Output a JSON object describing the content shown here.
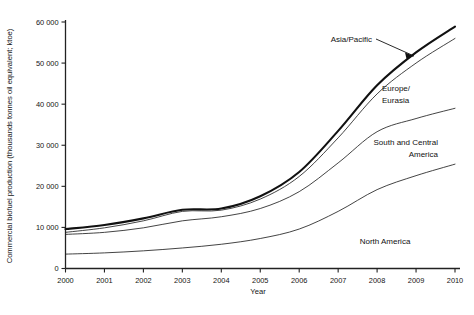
{
  "chart_data": {
    "type": "line",
    "title": "",
    "xlabel": "Year",
    "ylabel": "Commercial biofuel production (thousands tonnes oil equivalent; ktoe)",
    "x": [
      2000,
      2001,
      2002,
      2003,
      2004,
      2005,
      2006,
      2007,
      2008,
      2009,
      2010
    ],
    "xlim": [
      2000,
      2010
    ],
    "ylim": [
      0,
      60000
    ],
    "ytick_labels": [
      "0",
      "10 000",
      "20 000",
      "30 000",
      "40 000",
      "50 000",
      "60 000"
    ],
    "ytick_values": [
      0,
      10000,
      20000,
      30000,
      40000,
      50000,
      60000
    ],
    "xtick_labels": [
      "2000",
      "2001",
      "2002",
      "2003",
      "2004",
      "2005",
      "2006",
      "2007",
      "2008",
      "2009",
      "2010"
    ],
    "grid": false,
    "legend_position": "inline-annotations",
    "series": [
      {
        "name": "Asia/Pacific",
        "style": "thick",
        "values": [
          9600,
          10600,
          12200,
          14300,
          14600,
          17600,
          23500,
          33500,
          44600,
          52600,
          58900
        ]
      },
      {
        "name": "Europe/Eurasia",
        "style": "thin",
        "values": [
          8800,
          9900,
          11600,
          13900,
          14200,
          16900,
          22400,
          31800,
          42500,
          50000,
          56000
        ]
      },
      {
        "name": "South and Central America",
        "style": "thin",
        "values": [
          8300,
          8800,
          9900,
          11600,
          12600,
          14600,
          18700,
          25700,
          33300,
          36500,
          39000
        ]
      },
      {
        "name": "North America",
        "style": "thin",
        "values": [
          3500,
          3800,
          4300,
          5000,
          5900,
          7300,
          9600,
          13900,
          19200,
          22600,
          25400
        ]
      }
    ],
    "annotations": [
      {
        "name": "Asia/Pacific",
        "lines": [
          "Asia/Pacific"
        ],
        "align": "end",
        "leader": true
      },
      {
        "name": "Europe/Eurasia",
        "lines": [
          "Europe/",
          "Eurasia"
        ],
        "align": "start",
        "leader": false
      },
      {
        "name": "South and Central America",
        "lines": [
          "South and Central",
          "America"
        ],
        "align": "end",
        "leader": false
      },
      {
        "name": "North America",
        "lines": [
          "North America"
        ],
        "align": "center",
        "leader": false
      }
    ]
  },
  "labels": {
    "y_axis_title": "Commercial biofuel production (thousands tonnes oil equivalent; ktoe)",
    "x_axis_title": "Year",
    "asia_pacific": "Asia/Pacific",
    "europe_line1": "Europe/",
    "europe_line2": "Eurasia",
    "south_line1": "South and Central",
    "south_line2": "America",
    "north_america": "North America",
    "y0": "0",
    "y10": "10 000",
    "y20": "20 000",
    "y30": "30 000",
    "y40": "40 000",
    "y50": "50 000",
    "y60": "60 000",
    "x2000": "2000",
    "x2001": "2001",
    "x2002": "2002",
    "x2003": "2003",
    "x2004": "2004",
    "x2005": "2005",
    "x2006": "2006",
    "x2007": "2007",
    "x2008": "2008",
    "x2009": "2009",
    "x2010": "2010"
  },
  "colors": {
    "background": "#ffffff",
    "axis": "#222222",
    "curve": "#222222",
    "curve_emphasis": "#111111",
    "text": "#141414"
  }
}
